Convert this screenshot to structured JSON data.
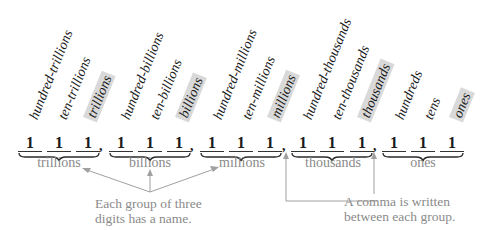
{
  "place_value_labels": [
    {
      "text": "hundred-trillions",
      "highlight": false
    },
    {
      "text": "ten-trillions",
      "highlight": false
    },
    {
      "text": "trillions",
      "highlight": true
    },
    {
      "text": "hundred-billions",
      "highlight": false
    },
    {
      "text": "ten-billions",
      "highlight": false
    },
    {
      "text": "billions",
      "highlight": true
    },
    {
      "text": "hundred-millions",
      "highlight": false
    },
    {
      "text": "ten-millions",
      "highlight": false
    },
    {
      "text": "millions",
      "highlight": true
    },
    {
      "text": "hundred-thousands",
      "highlight": false
    },
    {
      "text": "ten-thousands",
      "highlight": false
    },
    {
      "text": "thousands",
      "highlight": true
    },
    {
      "text": "hundreds",
      "highlight": false
    },
    {
      "text": "tens",
      "highlight": false
    },
    {
      "text": "ones",
      "highlight": true
    }
  ],
  "digits": [
    "1",
    "1",
    "1",
    "1",
    "1",
    "1",
    "1",
    "1",
    "1",
    "1",
    "1",
    "1",
    "1",
    "1",
    "1"
  ],
  "comma": ",",
  "groups": [
    {
      "name": "trillions"
    },
    {
      "name": "billions"
    },
    {
      "name": "millions"
    },
    {
      "name": "thousands"
    },
    {
      "name": "ones"
    }
  ],
  "notes": {
    "group_name": {
      "line1": "Each group of three",
      "line2": "digits has a name."
    },
    "comma": {
      "line1": "A comma is written",
      "line2": "between each group."
    }
  },
  "colors": {
    "text": "#1a1a1a",
    "annotation": "#8a8a8a",
    "highlight": "#d9d9d9",
    "arrow": "#a0a0a0"
  }
}
